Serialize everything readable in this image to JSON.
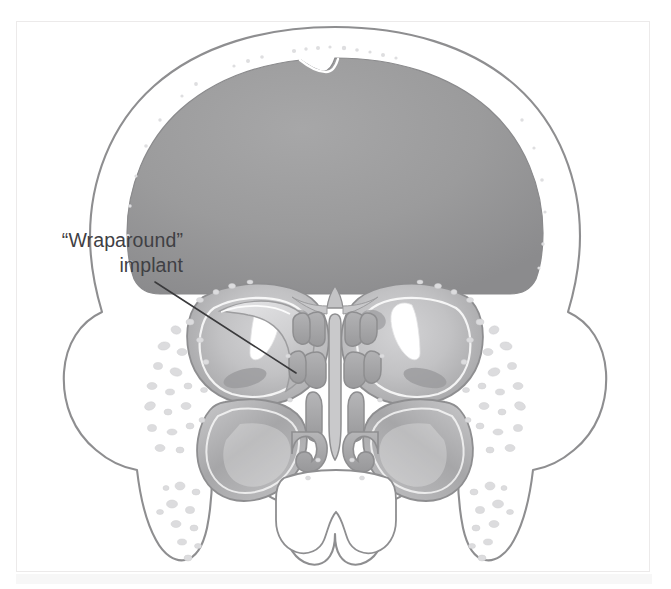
{
  "figure": {
    "kind": "medical-illustration",
    "view": "coronal section of the midface and cranium",
    "background_color": "#ffffff",
    "frame_border_color": "#eceaea",
    "bottom_strip_color": "#f7f7f7"
  },
  "annotations": {
    "implant_label": {
      "line1": "“Wraparound”",
      "line2": "implant",
      "text_color": "#3f4044",
      "font_size_px": 19.5,
      "align": "right",
      "leader_line": {
        "from_x": 155,
        "from_y": 282,
        "to_x": 296,
        "to_y": 373,
        "color": "#3a3a3c",
        "width_px": 1.6
      }
    }
  },
  "palette": {
    "outline": "#8e8e90",
    "outline_light": "#b4b4b6",
    "bone_fill": "#ffffff",
    "cancellous_speckle": "#dcdcde",
    "cranial_cavity": "#9a9a9a",
    "cranial_cavity_dark": "#8d8d8f",
    "orbit_soft_tissue": "#c2c2c4",
    "orbit_shadow": "#a9a9ab",
    "orbit_highlight": "#ffffff",
    "implant_band": "#d6d6d8",
    "implant_band_edge": "#9d9d9f",
    "sinus_mucosa": "#b0b0b2",
    "sinus_mucosa_dark": "#9c9c9e",
    "turbinate": "#a8a8aa",
    "air_space": "#ffffff",
    "ethmoid_cell": "#a5a5a7",
    "septum": "#bdbdbf"
  },
  "structures": [
    {
      "name": "cranial-vault",
      "label": "cranial vault / brain",
      "fill": "#9a9a9a"
    },
    {
      "name": "left-orbit",
      "label": "left orbit with wraparound implant",
      "fill": "#c2c2c4"
    },
    {
      "name": "right-orbit",
      "label": "right orbit",
      "fill": "#c2c2c4"
    },
    {
      "name": "ethmoid-air-cells",
      "label": "ethmoid air cells",
      "fill": "#a5a5a7"
    },
    {
      "name": "nasal-septum",
      "label": "nasal septum",
      "fill": "#bdbdbf"
    },
    {
      "name": "inferior-turbinates",
      "label": "inferior turbinates",
      "fill": "#a8a8aa"
    },
    {
      "name": "left-maxillary-sinus",
      "label": "left maxillary sinus",
      "fill": "#b0b0b2"
    },
    {
      "name": "right-maxillary-sinus",
      "label": "right maxillary sinus",
      "fill": "#b0b0b2"
    },
    {
      "name": "zygomatic-processes",
      "label": "zygomatic processes",
      "fill": "#ffffff"
    },
    {
      "name": "alveolar-processes",
      "label": "alveolar processes",
      "fill": "#ffffff"
    },
    {
      "name": "wraparound-implant",
      "label": "wraparound orbital implant",
      "fill": "#d6d6d8"
    }
  ]
}
